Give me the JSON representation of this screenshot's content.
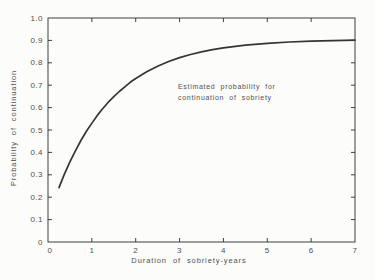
{
  "window": {
    "width": 375,
    "height": 280
  },
  "colors": {
    "background": "#fcfcfb",
    "axis": "#3f3f3f",
    "curve": "#353535",
    "text": "#4f4f4f"
  },
  "chart_data": {
    "type": "line",
    "title": "",
    "xlabel": "Duration of sobriety-years",
    "ylabel": "Probability of continuation",
    "xlim": [
      0,
      7
    ],
    "ylim": [
      0,
      1
    ],
    "grid": false,
    "legend": "none",
    "xticks": {
      "values": [
        0,
        1,
        2,
        3,
        4,
        5,
        6,
        7
      ],
      "labels": [
        "0",
        "1",
        "2",
        "3",
        "4",
        "5",
        "6",
        "7"
      ]
    },
    "yticks": {
      "values": [
        0,
        0.1,
        0.2,
        0.3,
        0.4,
        0.5,
        0.6,
        0.7,
        0.8,
        0.9,
        1.0
      ],
      "labels": [
        "0",
        "0.1",
        "0.2",
        "0.3",
        "0.4",
        "0.5",
        "0.6",
        "0.7",
        "0.8",
        "0.9",
        "1.0"
      ]
    },
    "annotation": {
      "lines": [
        "Estimated probability for",
        "continuation of sobriety"
      ],
      "x": 2.95,
      "y": 0.715
    },
    "series": [
      {
        "name": "Estimated probability of continuation of sobriety",
        "points": [
          [
            0.25,
            0.243
          ],
          [
            0.375,
            0.303
          ],
          [
            0.5,
            0.358
          ],
          [
            0.625,
            0.407
          ],
          [
            0.75,
            0.453
          ],
          [
            0.875,
            0.494
          ],
          [
            1.0,
            0.531
          ],
          [
            1.125,
            0.565
          ],
          [
            1.25,
            0.596
          ],
          [
            1.375,
            0.624
          ],
          [
            1.5,
            0.649
          ],
          [
            1.625,
            0.672
          ],
          [
            1.75,
            0.693
          ],
          [
            1.875,
            0.713
          ],
          [
            2.0,
            0.73
          ],
          [
            2.25,
            0.76
          ],
          [
            2.5,
            0.785
          ],
          [
            2.75,
            0.806
          ],
          [
            3.0,
            0.823
          ],
          [
            3.25,
            0.837
          ],
          [
            3.5,
            0.849
          ],
          [
            3.75,
            0.859
          ],
          [
            4.0,
            0.867
          ],
          [
            4.5,
            0.879
          ],
          [
            5.0,
            0.887
          ],
          [
            5.5,
            0.893
          ],
          [
            6.0,
            0.897
          ],
          [
            6.5,
            0.899
          ],
          [
            7.0,
            0.901
          ]
        ]
      }
    ]
  }
}
